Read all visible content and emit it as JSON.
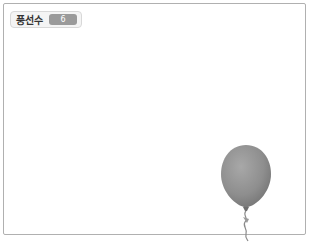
{
  "stage": {
    "monitor": {
      "label": "풍선수",
      "value": "6"
    },
    "sprites": [
      {
        "name": "balloon",
        "color": "#8f8f8f"
      }
    ]
  }
}
